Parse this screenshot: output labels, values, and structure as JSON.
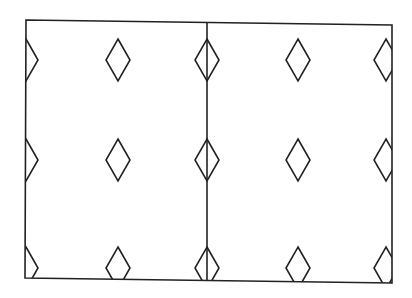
{
  "diagram": {
    "colors": {
      "stroke": "#222222",
      "background": "#ffffff"
    },
    "frame": {
      "tl": [
        26,
        20
      ],
      "tr": [
        392,
        25
      ],
      "br": [
        392,
        283
      ],
      "bl": [
        25,
        278
      ]
    },
    "divider": {
      "top": [
        207,
        22
      ],
      "bottom": [
        207,
        281
      ]
    },
    "diamond": {
      "half_width": 12,
      "half_height": 21
    },
    "columns_x": [
      26,
      118,
      207,
      298,
      386
    ],
    "rows_y": [
      60,
      160,
      268
    ]
  }
}
